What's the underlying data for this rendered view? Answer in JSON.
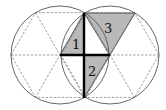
{
  "diagram": {
    "colors": {
      "circle_stroke": "#555555",
      "dash_stroke": "#777777",
      "shade_fill": "#b9b9b9",
      "thick_line": "#000000",
      "background": "#ffffff"
    },
    "labels": {
      "t1": "1",
      "t2": "2",
      "t3": "3"
    },
    "circles": [
      {
        "cx": 60,
        "cy": 55,
        "r": 49
      },
      {
        "cx": 110,
        "cy": 55,
        "r": 49
      }
    ],
    "shaded_triangles": [
      {
        "label": "1",
        "points": [
          [
            60,
            55
          ],
          [
            84,
            13
          ],
          [
            84,
            55
          ]
        ]
      },
      {
        "label": "2",
        "points": [
          [
            84,
            55
          ],
          [
            110,
            55
          ],
          [
            84,
            98
          ]
        ]
      },
      {
        "label": "3",
        "points": [
          [
            84,
            13
          ],
          [
            135,
            13
          ],
          [
            110,
            55
          ]
        ]
      }
    ],
    "thick_segments": [
      {
        "from": [
          84,
          13
        ],
        "to": [
          84,
          98
        ]
      },
      {
        "from": [
          60,
          55
        ],
        "to": [
          110,
          55
        ]
      }
    ]
  }
}
